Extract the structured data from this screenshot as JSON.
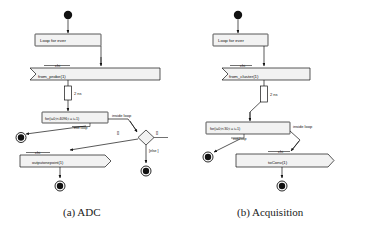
{
  "figure": {
    "panels": [
      {
        "id": "panel-a",
        "caption": "(a) ADC",
        "nodes": {
          "initial": "initial-node",
          "loop_box": "Loop for ever",
          "receive_signal_label": "chi",
          "receive_signal": "from_probe(1)",
          "delay": "2 ns",
          "for_loop": "for(i=0;i<4096;i = i+1)",
          "inside_loop": "inside loop",
          "exit_loop": "exit loop",
          "guard_left": "[]",
          "guard_right": "[]",
          "guard_else": "[else ]",
          "send_signal_label": "chi",
          "send_signal": "outputonepoint(1)",
          "final_left": "final-node",
          "final_bottom": "final-node",
          "final_right": "final-node"
        }
      },
      {
        "id": "panel-b",
        "caption": "(b) Acquisition",
        "nodes": {
          "initial": "initial-node",
          "loop_box": "Loop for ever",
          "receive_signal_label": "chi",
          "receive_signal": "from_cluster(1)",
          "delay": "2 ns",
          "for_loop": "for(i=0;i<30;i = i+1)",
          "inside_loop": "inside loop",
          "exit_loop": "exit loop",
          "send_signal_label": "chi",
          "send_signal": "toConv(1)",
          "final_left": "final-node",
          "final_bottom": "final-node"
        }
      }
    ],
    "colors": {
      "ink": "#111111",
      "fill": "#f2f2f2",
      "background": "#ffffff"
    }
  }
}
